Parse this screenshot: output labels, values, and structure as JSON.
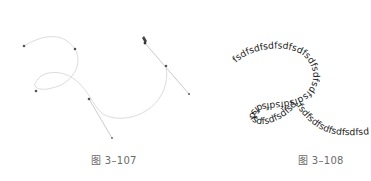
{
  "figures": [
    {
      "id": "left",
      "caption": "图 3–107",
      "description": "Bezier path with anchor points and direction handles, pen tool cursor",
      "colors": {
        "path": "#d8d8d8",
        "handle": "#b5b5b5",
        "anchor": "#555555"
      }
    },
    {
      "id": "right",
      "caption": "图 3–108",
      "path_text": "fsdfsdfsdfsdfsdfsdfsdfsdfsdfsdfsdfsdfsdfsdfsdfsdfsdfsdfsdfsdfsdfsdfsdfsdfsdfsdfsdf",
      "colors": {
        "text": "#222222"
      }
    }
  ]
}
